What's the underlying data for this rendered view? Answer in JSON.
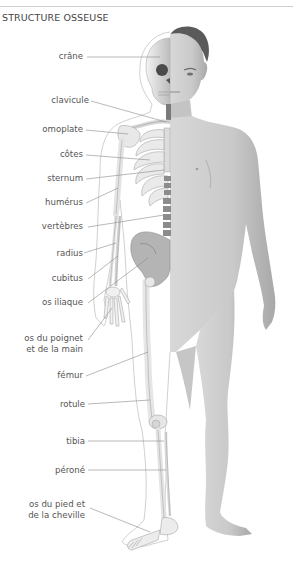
{
  "title": "STRUCTURE OSSEUSE",
  "colors": {
    "leader_line": "#8a8a8a",
    "bone": "#e6e6e6",
    "bone_shadow": "#a9a9a9",
    "skin": "#cfcfcf",
    "skin_shadow": "#9e9e9e",
    "hair": "#5e5e5e",
    "outline": "#bdbdbd"
  },
  "labels": [
    {
      "id": "crane",
      "text": "crâne"
    },
    {
      "id": "clavicule",
      "text": "clavicule"
    },
    {
      "id": "omoplate",
      "text": "omoplate"
    },
    {
      "id": "cotes",
      "text": "côtes"
    },
    {
      "id": "sternum",
      "text": "sternum"
    },
    {
      "id": "humerus",
      "text": "humérus"
    },
    {
      "id": "vertebres",
      "text": "vertèbres"
    },
    {
      "id": "radius",
      "text": "radius"
    },
    {
      "id": "cubitus",
      "text": "cubitus"
    },
    {
      "id": "os_iliaque",
      "text": "os iliaque"
    },
    {
      "id": "os_poignet",
      "text": "os du poignet\net de la main"
    },
    {
      "id": "femur",
      "text": "fémur"
    },
    {
      "id": "rotule",
      "text": "rotule"
    },
    {
      "id": "tibia",
      "text": "tibia"
    },
    {
      "id": "perone",
      "text": "péroné"
    },
    {
      "id": "os_pied",
      "text": "os du pied et\nde la cheville"
    }
  ]
}
